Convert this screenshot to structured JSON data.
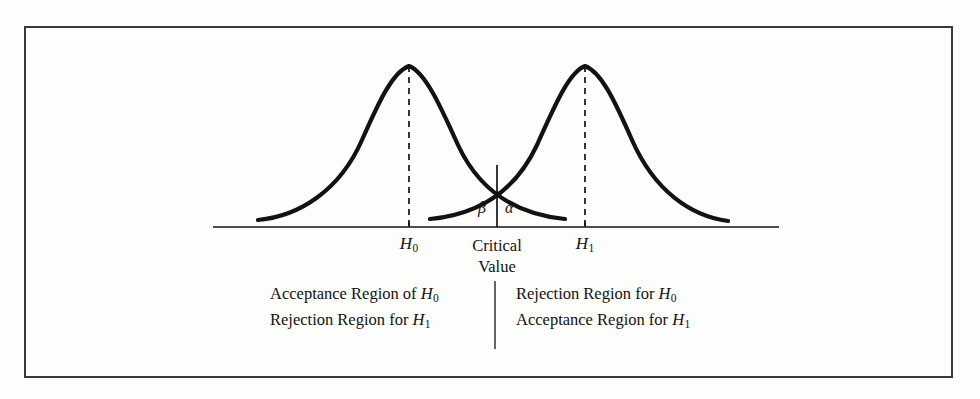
{
  "figure": {
    "kind": "statistical-hypothesis-test-diagram",
    "background_color": "#fdfdfb",
    "ink_color": "#121212",
    "frame_color": "#3a3a3c"
  },
  "axis": {
    "x_start": 213,
    "x_end": 779,
    "y": 227
  },
  "ticks": [
    {
      "id": "h0",
      "label": "H",
      "subscript": "0",
      "x": 409
    },
    {
      "id": "h1",
      "label": "H",
      "subscript": "1",
      "x": 585
    }
  ],
  "critical_value": {
    "x": 497,
    "label_line1": "Critical",
    "label_line2": "Value",
    "top_y": 165,
    "bottom_y": 227
  },
  "error_labels": [
    {
      "id": "beta",
      "symbol": "β",
      "x": 478,
      "y": 199,
      "meaning": "type-II-error-area"
    },
    {
      "id": "alpha",
      "symbol": "α",
      "x": 505,
      "y": 199,
      "meaning": "type-I-error-area"
    }
  ],
  "regions": {
    "left": {
      "line1_prefix": "Acceptance Region of ",
      "line1_var": "H",
      "line1_sub": "0",
      "line2_prefix": "Rejection Region for ",
      "line2_var": "H",
      "line2_sub": "1"
    },
    "right": {
      "line1_prefix": "Rejection Region for ",
      "line1_var": "H",
      "line1_sub": "0",
      "line2_prefix": "Acceptance Region for ",
      "line2_var": "H",
      "line2_sub": "1"
    },
    "divider": {
      "x": 495,
      "y_top": 281,
      "y_bottom": 349
    }
  },
  "chart_data": {
    "type": "line",
    "title": "",
    "xlabel": "",
    "ylabel": "",
    "grid": false,
    "legend": "none",
    "curve_style": {
      "stroke": "#121212",
      "stroke_width": 4.2,
      "fill": "none"
    },
    "dashed_style": {
      "stroke": "#121212",
      "stroke_width": 1.6,
      "dash": "6,5"
    },
    "series": [
      {
        "name": "Distribution under H0",
        "peak_x": 409,
        "peak_y": 66,
        "baseline_y": 222,
        "left_tail_x": 258,
        "right_tail_x": 565,
        "path": "M258,220 C300,216 340,190 362,140 C380,99 393,72 409,66 C425,72 440,105 458,145 C478,188 512,214 565,219"
      },
      {
        "name": "Distribution under H1",
        "peak_x": 585,
        "peak_y": 66,
        "baseline_y": 222,
        "left_tail_x": 430,
        "right_tail_x": 728,
        "path": "M430,219 C483,214 517,188 537,145 C555,105 569,72 585,66 C601,72 614,99 632,140 C654,190 690,216 728,221"
      }
    ],
    "annotations": [
      {
        "text": "β",
        "x": 478,
        "y": 199
      },
      {
        "text": "α",
        "x": 505,
        "y": 199
      },
      {
        "text": "H0",
        "x": 409,
        "y": 244
      },
      {
        "text": "H1",
        "x": 585,
        "y": 244
      },
      {
        "text": "Critical Value",
        "x": 497,
        "y": 244
      }
    ],
    "crossing_point": {
      "x": 497,
      "y": 165
    }
  }
}
